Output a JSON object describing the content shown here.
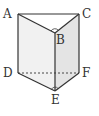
{
  "diagram": {
    "type": "triangular-prism",
    "colors": {
      "stroke": "#333333",
      "face_left": "#f1f1f1",
      "face_right": "#e4e4e4",
      "background": "#ffffff"
    },
    "vertices": {
      "A": {
        "label": "A",
        "x": 18,
        "y": 14
      },
      "B": {
        "label": "B",
        "x": 55,
        "y": 33
      },
      "C": {
        "label": "C",
        "x": 79,
        "y": 14
      },
      "D": {
        "label": "D",
        "x": 18,
        "y": 73
      },
      "E": {
        "label": "E",
        "x": 55,
        "y": 91
      },
      "F": {
        "label": "F",
        "x": 79,
        "y": 73
      }
    },
    "hidden_edges": [
      "DF"
    ],
    "right_angle_marks": [
      "ABC",
      "DEF"
    ]
  }
}
